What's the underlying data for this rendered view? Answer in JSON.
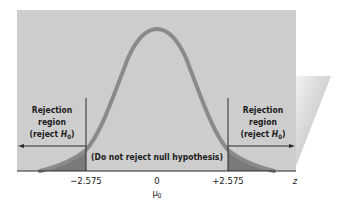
{
  "diagram": {
    "type": "two-tailed hypothesis test (normal distribution)",
    "colors": {
      "panel": "#cdcdcd",
      "side_wedge_light": "#efefef",
      "side_wedge_dark": "#a9a9a9",
      "curve": "#8a8a8a",
      "tail_fill": "#777777",
      "lines": "#2b2b2b"
    },
    "left_region": {
      "line1": "Rejection",
      "line2": "region",
      "line3_prefix": "(reject ",
      "line3_var": "H",
      "line3_sub": "0",
      "line3_suffix": ")"
    },
    "right_region": {
      "line1": "Rejection",
      "line2": "region",
      "line3_prefix": "(reject ",
      "line3_var": "H",
      "line3_sub": "0",
      "line3_suffix": ")"
    },
    "center_label": "(Do not reject null hypothesis)",
    "axis": {
      "left_critical": "−2.575",
      "center": "0",
      "mean_symbol": "μ",
      "mean_sub": "0",
      "right_critical": "+2.575",
      "variable": "z"
    }
  }
}
